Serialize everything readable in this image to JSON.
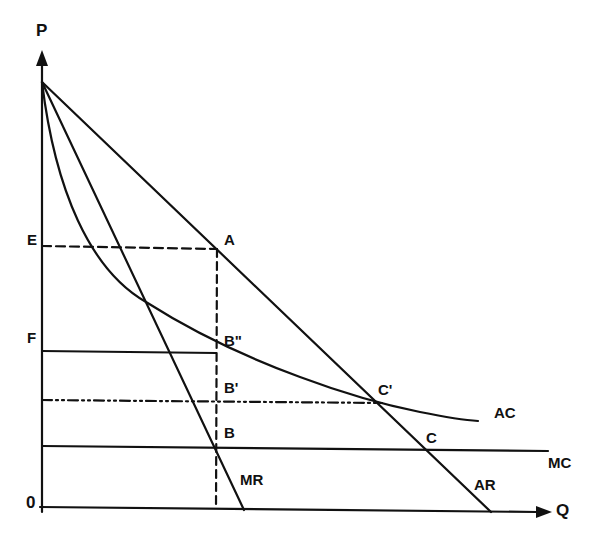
{
  "diagram": {
    "axes": {
      "y_label": "P",
      "x_label": "Q",
      "origin_label": "0"
    },
    "price_levels": {
      "E": "E",
      "F": "F"
    },
    "points": {
      "A": "A",
      "B_double_prime": "B\"",
      "B_prime": "B'",
      "B": "B",
      "C_prime": "C'",
      "C": "C"
    },
    "curves": {
      "AC": "AC",
      "MC": "MC",
      "MR": "MR",
      "AR": "AR"
    },
    "colors": {
      "ink": "#111111",
      "background": "#ffffff"
    }
  }
}
